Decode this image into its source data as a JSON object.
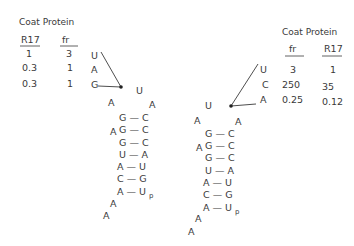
{
  "left_table": {
    "header": "Coat  Protein",
    "col1": "R17",
    "col2": "fr",
    "rows": [
      {
        "r17": "1",
        "fr": "3",
        "base": "U"
      },
      {
        "r17": "0.3",
        "fr": "1",
        "base": "A"
      },
      {
        "r17": "0.3",
        "fr": "1",
        "base": "G"
      }
    ]
  },
  "right_table": {
    "header": "Coat  Protein",
    "col1": "fr",
    "col2": "R17",
    "rows": [
      {
        "base": "U",
        "fr": "3",
        "r17": "1"
      },
      {
        "base": "C",
        "fr": "250",
        "r17": "35"
      },
      {
        "base": "A",
        "fr": "0.25",
        "r17": "0.12"
      }
    ]
  },
  "left_hairpin": {
    "loop": {
      "top": "U",
      "left": "A",
      "right": "A"
    },
    "bulge": "A",
    "pairs": [
      "G — C",
      "G — C",
      "G — C",
      "U — A",
      "A — U",
      "C — G",
      "A — U"
    ],
    "terminal_subscript": "p",
    "tail": [
      "A",
      "A"
    ]
  },
  "right_hairpin": {
    "loop": {
      "top": "U",
      "left": "A",
      "right": "A"
    },
    "bulge": "A",
    "pairs": [
      "G — C",
      "G — C",
      "G — C",
      "U — A",
      "A — U",
      "C — G",
      "A — U"
    ],
    "terminal_subscript": "p",
    "tail": [
      "A",
      "A"
    ]
  }
}
